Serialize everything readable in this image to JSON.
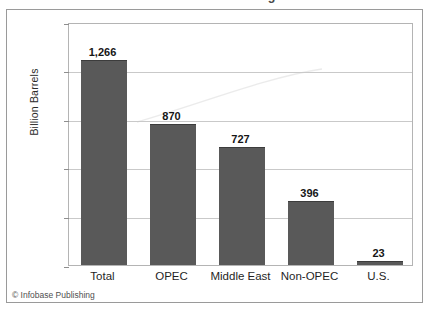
{
  "chart_data": {
    "type": "bar",
    "title": "World Oil Reserves through 2011",
    "categories": [
      "Total",
      "OPEC",
      "Middle East",
      "Non-OPEC",
      "U.S."
    ],
    "values": [
      1266,
      870,
      727,
      396,
      23
    ],
    "value_labels": [
      "1,266",
      "870",
      "727",
      "396",
      "23"
    ],
    "xlabel": "",
    "ylabel": "Billion Barrels",
    "ylim": [
      0,
      1500
    ],
    "yticks": [
      0,
      300,
      600,
      900,
      1200,
      1500
    ],
    "ytick_labels": [
      "0",
      "300",
      "600",
      "900",
      "1,200",
      "1,500"
    ],
    "grid": true,
    "legend": false,
    "bar_color": "#595959",
    "frame_color": "#b4b4b4",
    "gridline_color": "#c9c9c9"
  },
  "credit": "© Infobase Publishing"
}
